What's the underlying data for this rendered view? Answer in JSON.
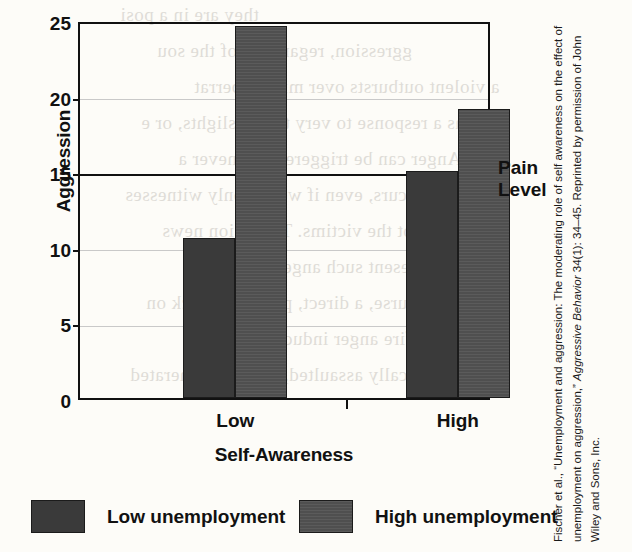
{
  "chart_data": {
    "type": "bar",
    "title": "",
    "xlabel": "Self-Awareness",
    "ylabel": "Aggression",
    "categories": [
      "Low",
      "High"
    ],
    "series": [
      {
        "name": "Low unemployment",
        "values": [
          10.6,
          15.0
        ],
        "color": "#3a3a3a"
      },
      {
        "name": "High unemployment",
        "values": [
          24.6,
          19.1
        ],
        "color": "#4f4f4f"
      }
    ],
    "ylim": [
      0,
      25
    ],
    "yticks": [
      0,
      5,
      10,
      15,
      20,
      25
    ],
    "ytick_labels": [
      "0",
      "5",
      "10",
      "15",
      "20",
      "25"
    ],
    "grid": true,
    "legend_position": "bottom",
    "annotations": [
      {
        "name": "pain-level",
        "type": "hline",
        "value": 15,
        "label_line1": "Pain",
        "label_line2": "Level"
      }
    ]
  },
  "axis": {
    "y_title": "Aggression",
    "x_title": "Self-Awareness",
    "y_ticks": [
      "25",
      "20",
      "15",
      "10",
      "5",
      "0"
    ],
    "x_categories": [
      "Low",
      "High"
    ]
  },
  "annotation": {
    "pain_level_line1": "Pain",
    "pain_level_line2": "Level"
  },
  "legend": {
    "items": [
      {
        "label": "Low unemployment",
        "color": "#3a3a3a"
      },
      {
        "label": "High unemployment",
        "color": "#4f4f4f"
      }
    ]
  },
  "credit": {
    "part1": "Fischer et al., “Unemployment and aggression: The moderating role of self awareness on the effect of unemployment on aggression,” ",
    "journal": "Aggressive Behavior",
    "part2": " 34(1): 34–45. Reprinted by permission of John Wiley and Sons, Inc."
  },
  "bleed_text": [
    "they are in a posi",
    "ggression, regardless of the sou",
    "a violent outbursts over minor aberrat",
    "as a response to very trivial slights, or e",
    "r. Anger can be triggered whenever a",
    "occurs, even if we are only witnesses",
    "d not the victims. Television news",
    "often present such anger-inducing",
    "of course, a direct, physical attack on",
    "n a sure-fire anger inducer. When we",
    "ysically assaulted, the pain generated"
  ]
}
